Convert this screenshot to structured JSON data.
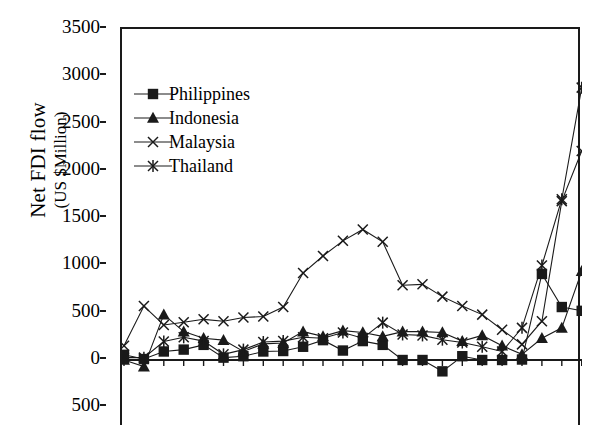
{
  "chart_data": {
    "type": "line",
    "title": "",
    "xlabel": "",
    "ylabel": "Net FDI flow (US $Million)",
    "ylabel_line1": "Net FDI flow",
    "ylabel_line2": "(US $Million)",
    "ylim": [
      -500,
      3500
    ],
    "ytick_labels": [
      "3500",
      "3000",
      "2500",
      "2000",
      "1500",
      "1000",
      "500",
      "0",
      "500"
    ],
    "ytick_values": [
      3500,
      3000,
      2500,
      2000,
      1500,
      1000,
      500,
      0,
      -500
    ],
    "grid": false,
    "legend_position": "upper-left-inside",
    "n_points": 24,
    "x_indices": [
      0,
      1,
      2,
      3,
      4,
      5,
      6,
      7,
      8,
      9,
      10,
      11,
      12,
      13,
      14,
      15,
      16,
      17,
      18,
      19,
      20,
      21,
      22,
      23
    ],
    "series": [
      {
        "name": "Philippines",
        "marker": "filled-square",
        "color": "#1a1a1a",
        "values": [
          55,
          10,
          90,
          110,
          160,
          25,
          40,
          90,
          95,
          140,
          210,
          100,
          200,
          160,
          0,
          0,
          -120,
          40,
          0,
          0,
          5,
          910,
          560,
          520
        ]
      },
      {
        "name": "Indonesia",
        "marker": "filled-triangle",
        "color": "#1a1a1a",
        "values": [
          0,
          -70,
          480,
          300,
          230,
          210,
          90,
          170,
          180,
          300,
          250,
          310,
          290,
          250,
          300,
          300,
          290,
          200,
          260,
          150,
          60,
          230,
          340,
          940
        ]
      },
      {
        "name": "Malaysia",
        "marker": "cross-x",
        "color": "#1a1a1a",
        "values": [
          150,
          570,
          370,
          400,
          430,
          410,
          450,
          460,
          560,
          920,
          1100,
          1260,
          1380,
          1250,
          790,
          800,
          670,
          570,
          480,
          320,
          165,
          410,
          1680,
          2210
        ]
      },
      {
        "name": "Thailand",
        "marker": "star-asterisk",
        "color": "#1a1a1a",
        "values": [
          25,
          25,
          195,
          240,
          200,
          60,
          110,
          190,
          200,
          240,
          230,
          290,
          230,
          395,
          270,
          260,
          215,
          185,
          140,
          90,
          340,
          1000,
          1700,
          2880
        ]
      }
    ]
  },
  "legend": {
    "items": [
      {
        "label": "Philippines",
        "marker": "filled-square"
      },
      {
        "label": "Indonesia",
        "marker": "filled-triangle"
      },
      {
        "label": "Malaysia",
        "marker": "cross-x"
      },
      {
        "label": "Thailand",
        "marker": "star-asterisk"
      }
    ]
  },
  "axis": {
    "y_title_line1": "Net FDI flow",
    "y_title_line2": "(US $Million)",
    "ticks": [
      {
        "label": "3500"
      },
      {
        "label": "3000"
      },
      {
        "label": "2500"
      },
      {
        "label": "2000"
      },
      {
        "label": "1500"
      },
      {
        "label": "1000"
      },
      {
        "label": "500"
      },
      {
        "label": "0"
      },
      {
        "label": "500"
      }
    ]
  }
}
